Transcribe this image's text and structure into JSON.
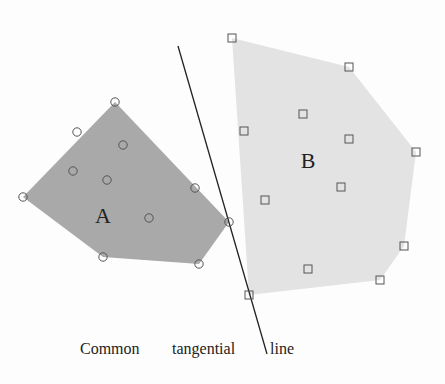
{
  "diagram": {
    "set_a": {
      "label": "A",
      "fill": "#a9a9a9",
      "label_pos": [
        103,
        223
      ],
      "hull": [
        [
          23,
          197
        ],
        [
          115,
          102
        ],
        [
          229,
          222
        ],
        [
          199,
          264
        ],
        [
          103,
          257
        ]
      ],
      "points": [
        [
          115,
          102
        ],
        [
          77,
          132
        ],
        [
          123,
          145
        ],
        [
          73,
          171
        ],
        [
          107,
          180
        ],
        [
          23,
          197
        ],
        [
          195,
          188
        ],
        [
          149,
          218
        ],
        [
          229,
          222
        ],
        [
          103,
          257
        ],
        [
          199,
          264
        ]
      ]
    },
    "set_b": {
      "label": "B",
      "fill": "#e3e3e3",
      "label_pos": [
        308,
        168
      ],
      "hull": [
        [
          232,
          38
        ],
        [
          349,
          67
        ],
        [
          416,
          152
        ],
        [
          404,
          246
        ],
        [
          380,
          280
        ],
        [
          249,
          295
        ]
      ],
      "points": [
        [
          232,
          38
        ],
        [
          349,
          67
        ],
        [
          303,
          114
        ],
        [
          244,
          131
        ],
        [
          349,
          139
        ],
        [
          416,
          152
        ],
        [
          341,
          187
        ],
        [
          265,
          200
        ],
        [
          404,
          246
        ],
        [
          308,
          269
        ],
        [
          380,
          280
        ],
        [
          249,
          295
        ]
      ]
    },
    "tangent_line": {
      "x1": 178,
      "y1": 46,
      "x2": 267,
      "y2": 354,
      "color": "#222"
    },
    "caption": {
      "part1": "Common",
      "part2": "tangential",
      "part3": "line"
    }
  }
}
